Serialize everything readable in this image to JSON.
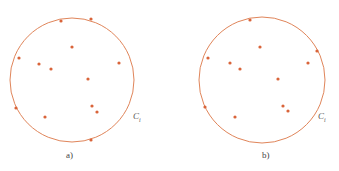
{
  "panels": [
    {
      "label": "a)",
      "circle_label": "C",
      "circle_subscript": "i",
      "circle": {
        "cx": 72,
        "cy": 80,
        "r": 62
      },
      "points": [
        [
          61,
          21
        ],
        [
          91,
          19
        ],
        [
          72,
          47
        ],
        [
          19,
          58
        ],
        [
          39,
          64
        ],
        [
          51,
          69
        ],
        [
          119,
          63
        ],
        [
          88,
          79
        ],
        [
          16,
          108
        ],
        [
          92,
          106
        ],
        [
          97,
          112
        ],
        [
          45,
          117
        ],
        [
          91,
          140
        ]
      ]
    },
    {
      "label": "b)",
      "circle_label": "C",
      "circle_subscript": "i",
      "circle": {
        "cx": 262,
        "cy": 80,
        "r": 63
      },
      "points": [
        [
          250,
          20
        ],
        [
          260,
          47
        ],
        [
          208,
          58
        ],
        [
          230,
          63
        ],
        [
          240,
          69
        ],
        [
          308,
          63
        ],
        [
          317,
          51
        ],
        [
          278,
          79
        ],
        [
          205,
          107
        ],
        [
          283,
          106
        ],
        [
          288,
          111
        ],
        [
          235,
          117
        ]
      ]
    }
  ],
  "colors": {
    "circle": "#e0855a",
    "point": "#d9643a"
  }
}
